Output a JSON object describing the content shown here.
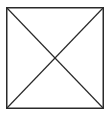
{
  "placeholder": {
    "icon": "image-placeholder-icon",
    "stroke_color": "#2a2a2a",
    "background_color": "#ffffff"
  }
}
